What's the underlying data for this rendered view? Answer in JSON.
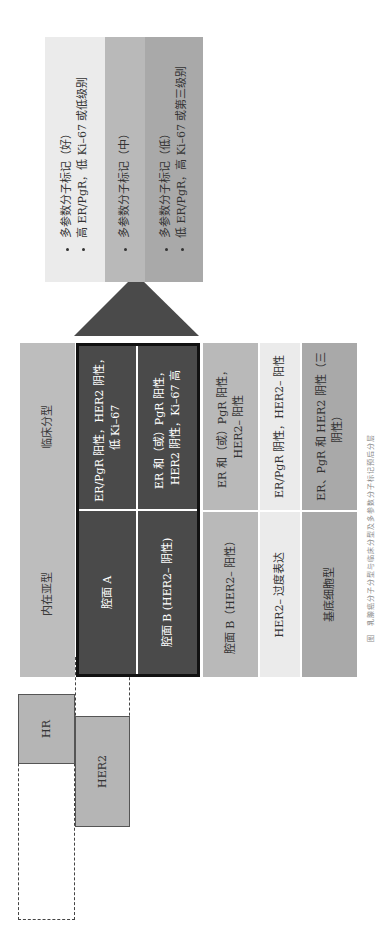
{
  "figure": {
    "receptor_bars": {
      "hr_label": "HR",
      "her2_label": "HER2"
    },
    "headers": {
      "intrinsic": "内在亚型",
      "clinical": "临床分型"
    },
    "rows": [
      {
        "intrinsic": "腔面 A",
        "clinical": "ER/PgR 阳性，HER2 阴性，低 Ki–67",
        "style": "dark"
      },
      {
        "intrinsic": "腔面 B (HER2– 阴性)",
        "clinical": "ER 和（或）PgR 阳性，HER2 阴性，Ki–67 高",
        "style": "dark"
      },
      {
        "intrinsic": "腔面 B（HER2– 阳性）",
        "clinical": "ER 和（或）PgR 阳性，HER2– 阳性",
        "style": "mid"
      },
      {
        "intrinsic": "HER2– 过度表达",
        "clinical": "ER/PgR 阴性，HER2– 阳性",
        "style": "light"
      },
      {
        "intrinsic": "基底细胞型",
        "clinical": "ER、PgR 和 HER2 阴性（三阴性）",
        "style": "midgray"
      }
    ],
    "arrow_label": "HR 阳性，HER2 阴性",
    "outcomes": [
      {
        "lines": [
          "多参数分子标记（好）",
          "高 ER/PgR，低 Ki–67 或低级别"
        ],
        "style": "light"
      },
      {
        "lines": [
          "多参数分子标记（中）"
        ],
        "style": "mid"
      },
      {
        "lines": [
          "多参数分子标记（低）",
          "低 ER/PgR，高 Ki–67 或第三级别"
        ],
        "style": "midgray"
      }
    ],
    "caption": "图　乳腺癌分子分型与临床分型及多参数分子标记预后分层"
  }
}
